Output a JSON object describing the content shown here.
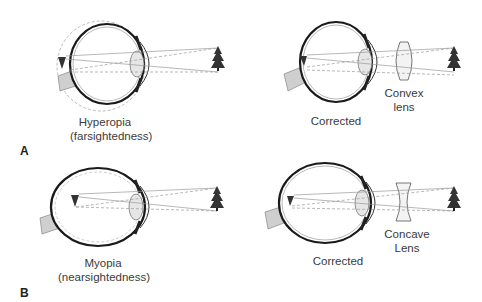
{
  "figure": {
    "panels": [
      {
        "letter": "A",
        "condition": {
          "name": "Hyperopia",
          "subname": "(farsightedness)"
        },
        "corrected": {
          "label": "Corrected",
          "lens_label_line1": "Convex",
          "lens_label_line2": "lens",
          "lens_type": "convex"
        }
      },
      {
        "letter": "B",
        "condition": {
          "name": "Myopia",
          "subname": "(nearsightedness)"
        },
        "corrected": {
          "label": "Corrected",
          "lens_label_line1": "Concave",
          "lens_label_line2": "Lens",
          "lens_type": "concave"
        }
      }
    ],
    "icons": {
      "object": "tree-icon",
      "image": "inverted-triangle-image-icon"
    },
    "colors": {
      "outline": "#1a1a1a",
      "ray": "#9a9a9a",
      "optic_nerve": "#cfcfcf",
      "tree": "#333333",
      "lens_fill": "#eeeeee"
    }
  }
}
